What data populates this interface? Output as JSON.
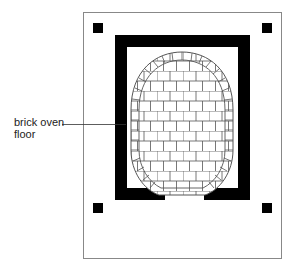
{
  "diagram": {
    "label": {
      "line1": "brick oven",
      "line2": "floor"
    },
    "colors": {
      "wall": "#000000",
      "frame": "#888888",
      "brick_line": "#555555",
      "background": "#ffffff"
    },
    "corner_posts": 4
  }
}
